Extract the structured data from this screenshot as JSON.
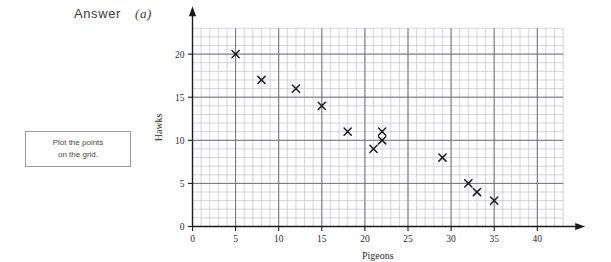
{
  "header": {
    "answer_label": "Answer",
    "part_label": "(a)"
  },
  "instruction_box": {
    "line1": "Plot the points",
    "line2": "on the grid."
  },
  "chart_data": {
    "type": "scatter",
    "title": "",
    "xlabel": "Pigeons",
    "ylabel": "Hawks",
    "xlim": [
      0,
      43
    ],
    "ylim": [
      0,
      23
    ],
    "xticks": [
      0,
      5,
      10,
      15,
      20,
      25,
      30,
      35,
      40
    ],
    "yticks": [
      0,
      5,
      10,
      15,
      20
    ],
    "grid": true,
    "grid_minor_step": 1,
    "grid_major_step": 5,
    "legend": "none",
    "marker": "x",
    "marker_color": "#1a1a1a",
    "axis_color": "#1a1a1a",
    "grid_minor_color": "#b9b9c4",
    "grid_major_color": "#6d6d78",
    "points": [
      {
        "x": 5,
        "y": 20
      },
      {
        "x": 8,
        "y": 17
      },
      {
        "x": 12,
        "y": 16
      },
      {
        "x": 15,
        "y": 14
      },
      {
        "x": 18,
        "y": 11
      },
      {
        "x": 22,
        "y": 11
      },
      {
        "x": 22,
        "y": 10
      },
      {
        "x": 21,
        "y": 9
      },
      {
        "x": 29,
        "y": 8
      },
      {
        "x": 32,
        "y": 5
      },
      {
        "x": 33,
        "y": 4
      },
      {
        "x": 35,
        "y": 3
      }
    ]
  }
}
